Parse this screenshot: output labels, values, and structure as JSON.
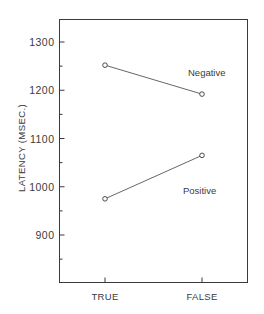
{
  "chart_data": {
    "type": "line",
    "title": "",
    "xlabel": "",
    "ylabel": "LATENCY (MSEC.)",
    "categories": [
      "TRUE",
      "FALSE"
    ],
    "series": [
      {
        "name": "Negative",
        "values": [
          1252,
          1192
        ]
      },
      {
        "name": "Positive",
        "values": [
          975,
          1065
        ]
      }
    ],
    "yticks": [
      900,
      1000,
      1100,
      1200,
      1300
    ],
    "ylim": [
      810,
      1345
    ],
    "minor_ticks": true,
    "grid": false,
    "legend": "inline labels next to lines",
    "marker": "open-circle"
  }
}
